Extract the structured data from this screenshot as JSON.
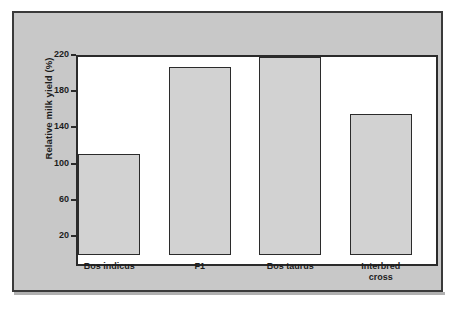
{
  "chart_data": {
    "type": "bar",
    "title": "",
    "subtitle": "",
    "xlabel": "",
    "ylabel": "Relative milk yield (%)",
    "categories": [
      "Bos indicus",
      "F1",
      "Bos taurus",
      "Interbred\ncross"
    ],
    "values": [
      99,
      195,
      206,
      143
    ],
    "ylim": [
      -13,
      220
    ],
    "yticks": [
      20,
      60,
      100,
      140,
      180,
      220
    ],
    "ytick_labels": [
      "20",
      "60",
      "100",
      "140",
      "180",
      "220"
    ],
    "grid": false,
    "legend": null,
    "bar_fill_color": "#d2d2d2",
    "bar_edge_color": "#2b2b2b",
    "panel_background_color": "#c8c8c8",
    "plot_background_color": "#ffffff",
    "text_color": "#1d1d1d"
  },
  "axis": {
    "y_title": "Relative milk yield (%)",
    "ticks": [
      {
        "label": "220",
        "value": 220
      },
      {
        "label": "180",
        "value": 180
      },
      {
        "label": "140",
        "value": 140
      },
      {
        "label": "100",
        "value": 100
      },
      {
        "label": "60",
        "value": 60
      },
      {
        "label": "20",
        "value": 20
      }
    ]
  },
  "bars": [
    {
      "label": "Bos indicus",
      "value": 99
    },
    {
      "label": "F1",
      "value": 195
    },
    {
      "label": "Bos taurus",
      "value": 206
    },
    {
      "label": "Interbred\ncross",
      "value": 143
    }
  ]
}
